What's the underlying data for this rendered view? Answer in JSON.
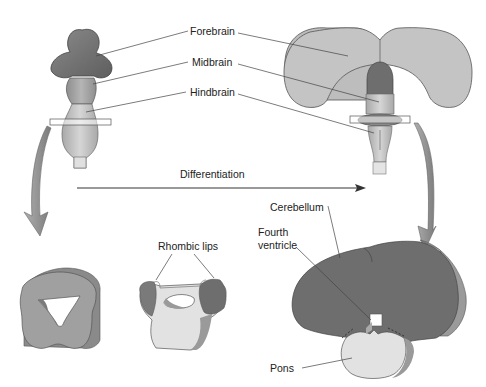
{
  "labels": {
    "forebrain": "Forebrain",
    "midbrain": "Midbrain",
    "hindbrain": "Hindbrain",
    "differentiation": "Differentiation",
    "rhombic_lips": "Rhombic lips",
    "cerebellum": "Cerebellum",
    "fourth_ventricle_line1": "Fourth",
    "fourth_ventricle_line2": "ventricle",
    "pons": "Pons"
  },
  "colors": {
    "dark": "#6e6e6e",
    "mid": "#9a9a9a",
    "light": "#c4c4c4",
    "pale": "#e6e6e6",
    "line": "#555555"
  }
}
